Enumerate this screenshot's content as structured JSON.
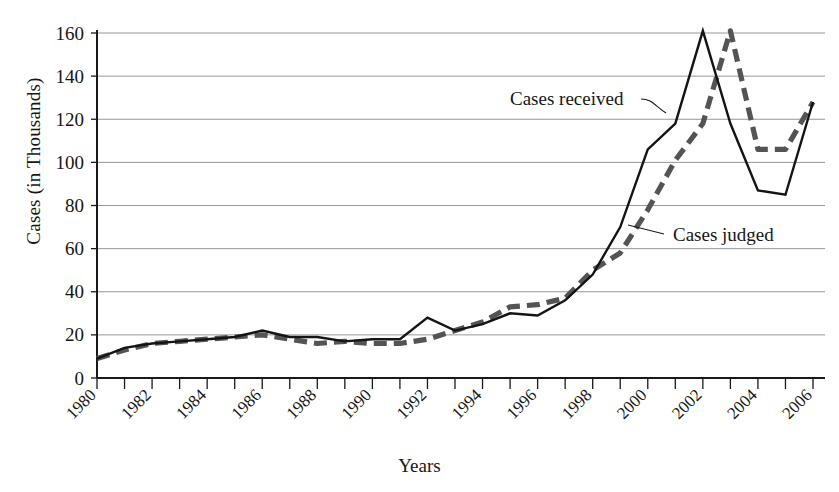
{
  "chart_data": {
    "type": "line",
    "title": "",
    "xlabel": "Years",
    "ylabel": "Cases (in Thousands)",
    "xlim": [
      1980,
      2006
    ],
    "ylim": [
      0,
      160
    ],
    "yticks": [
      0,
      20,
      40,
      60,
      80,
      100,
      120,
      140,
      160
    ],
    "ytick_labels": [
      "0",
      "20",
      "40",
      "60",
      "80",
      "100",
      "120",
      "140",
      "160"
    ],
    "xticks": [
      1980,
      1981,
      1982,
      1983,
      1984,
      1985,
      1986,
      1987,
      1988,
      1989,
      1990,
      1991,
      1992,
      1993,
      1994,
      1995,
      1996,
      1997,
      1998,
      1999,
      2000,
      2001,
      2002,
      2003,
      2004,
      2005,
      2006
    ],
    "xtick_labels": [
      "1980",
      "1982",
      "1984",
      "1986",
      "1988",
      "1990",
      "1992",
      "1994",
      "1996",
      "1998",
      "2000",
      "2002",
      "2004",
      "2006"
    ],
    "xtick_labels_years": [
      1980,
      1982,
      1984,
      1986,
      1988,
      1990,
      1992,
      1994,
      1996,
      1998,
      2000,
      2002,
      2004,
      2006
    ],
    "grid": true,
    "grid_axis": "y",
    "legend_position": "inline-annotations",
    "x": [
      1980,
      1981,
      1982,
      1983,
      1984,
      1985,
      1986,
      1987,
      1988,
      1989,
      1990,
      1991,
      1992,
      1993,
      1994,
      1995,
      1996,
      1997,
      1998,
      1999,
      2000,
      2001,
      2002,
      2003,
      2004,
      2005,
      2006
    ],
    "series": [
      {
        "name": "Cases received",
        "style": "solid",
        "color": "#141414",
        "values": [
          9,
          14,
          16,
          17,
          18,
          19,
          22,
          19,
          19,
          17,
          18,
          18,
          28,
          22,
          25,
          30,
          29,
          36,
          48,
          70,
          106,
          118,
          161,
          118,
          87,
          85,
          128
        ]
      },
      {
        "name": "Cases judged",
        "style": "dashed",
        "color": "#545454",
        "values": [
          9,
          13,
          16,
          17,
          18,
          19,
          20,
          18,
          16,
          17,
          16,
          16,
          18,
          22,
          26,
          33,
          34,
          37,
          50,
          58,
          78,
          101,
          118,
          161,
          106,
          106,
          128
        ]
      }
    ],
    "annotations": [
      {
        "text": "Cases received",
        "points_to_series": "Cases received",
        "points_to_year": 2001
      },
      {
        "text": "Cases judged",
        "points_to_series": "Cases judged",
        "points_to_year": 1999
      }
    ]
  }
}
